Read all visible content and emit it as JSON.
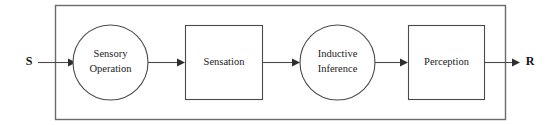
{
  "diagram": {
    "background_color": "#ffffff",
    "stroke_color": "#4a4a4a",
    "frame_color": "#6b6b6b",
    "text_color": "#1a1a1a",
    "terminals": {
      "input": {
        "label": "S",
        "name": "stimulus-terminal"
      },
      "output": {
        "label": "R",
        "name": "response-terminal"
      }
    },
    "nodes": [
      {
        "id": "sensory-operation",
        "shape": "circle",
        "line1": "Sensory",
        "line2": "Operation"
      },
      {
        "id": "sensation",
        "shape": "rectangle",
        "line1": "Sensation",
        "line2": ""
      },
      {
        "id": "inductive-inference",
        "shape": "circle",
        "line1": "Inductive",
        "line2": "Inference"
      },
      {
        "id": "perception",
        "shape": "rectangle",
        "line1": "Perception",
        "line2": ""
      }
    ],
    "connectors": [
      {
        "from": "S",
        "to": "sensory-operation"
      },
      {
        "from": "sensory-operation",
        "to": "sensation"
      },
      {
        "from": "sensation",
        "to": "inductive-inference"
      },
      {
        "from": "inductive-inference",
        "to": "perception"
      },
      {
        "from": "perception",
        "to": "R"
      }
    ]
  }
}
